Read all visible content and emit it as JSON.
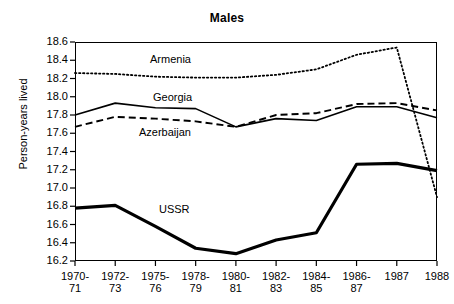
{
  "chart_data": {
    "type": "line",
    "title": "Males",
    "xlabel": "",
    "ylabel": "Person-years lived",
    "ylim": [
      16.2,
      18.6
    ],
    "yticks": [
      "16.2",
      "16.4",
      "16.6",
      "16.8",
      "17.0",
      "17.2",
      "17.4",
      "17.6",
      "17.8",
      "18.0",
      "18.2",
      "18.4",
      "18.6"
    ],
    "grid": false,
    "legend": "inline-labels",
    "categories": [
      "1970-\n71",
      "1972-\n73",
      "1975-\n76",
      "1978-\n79",
      "1980-\n81",
      "1982-\n83",
      "1984-\n85",
      "1986-\n87",
      "1987",
      "1988"
    ],
    "series": [
      {
        "name": "Armenia",
        "style": "dotted",
        "values": [
          18.26,
          18.25,
          18.22,
          18.21,
          18.21,
          18.24,
          18.3,
          18.46,
          18.54,
          16.9
        ]
      },
      {
        "name": "Georgia",
        "style": "solid-thin",
        "values": [
          17.8,
          17.93,
          17.88,
          17.87,
          17.67,
          17.76,
          17.74,
          17.89,
          17.89,
          17.77
        ]
      },
      {
        "name": "Azerbaijan",
        "style": "dashed",
        "values": [
          17.67,
          17.78,
          17.76,
          17.73,
          17.67,
          17.8,
          17.82,
          17.92,
          17.93,
          17.85
        ]
      },
      {
        "name": "USSR",
        "style": "solid-thick",
        "values": [
          16.78,
          16.81,
          16.58,
          16.34,
          16.28,
          16.43,
          16.51,
          17.26,
          17.27,
          17.19
        ]
      }
    ],
    "annotations": [
      {
        "text": "Armenia",
        "series": "Armenia"
      },
      {
        "text": "Georgia",
        "series": "Georgia"
      },
      {
        "text": "Azerbaijan",
        "series": "Azerbaijan"
      },
      {
        "text": "USSR",
        "series": "USSR"
      }
    ]
  },
  "labels": {
    "armenia": "Armenia",
    "georgia": "Georgia",
    "azerbaijan": "Azerbaijan",
    "ussr": "USSR"
  }
}
